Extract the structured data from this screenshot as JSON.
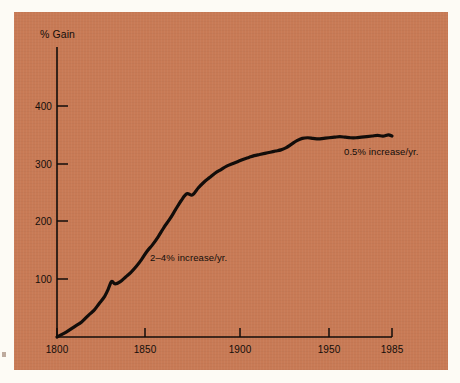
{
  "figure": {
    "background_color": "#fdfbf5",
    "panel_color": "#c87a55",
    "ink_color": "#120d0a"
  },
  "chart_data": {
    "type": "line",
    "title": "",
    "subtitle": "",
    "xlabel": "",
    "ylabel": "% Gain",
    "axis_label_text": "% Gain",
    "grid": false,
    "legend": "none",
    "xlim": [
      1800,
      1985
    ],
    "ylim": [
      0,
      460
    ],
    "xticks": [
      1800,
      1850,
      1900,
      1950,
      1985
    ],
    "xticklabels": [
      "1800",
      "1850",
      "1900",
      "1950",
      "1985"
    ],
    "yticks": [
      100,
      200,
      300,
      400
    ],
    "yticklabels": [
      "100",
      "200",
      "300",
      "400"
    ],
    "series": [
      {
        "name": "% Gain",
        "color": "#120d0a",
        "x": [
          1800,
          1805,
          1810,
          1814,
          1818,
          1821,
          1824,
          1827,
          1829,
          1831,
          1833,
          1836,
          1839,
          1842,
          1845,
          1848,
          1851,
          1854,
          1857,
          1860,
          1863,
          1866,
          1869,
          1872,
          1875,
          1878,
          1881,
          1884,
          1887,
          1890,
          1893,
          1896,
          1899,
          1902,
          1905,
          1908,
          1911,
          1914,
          1917,
          1920,
          1923,
          1926,
          1929,
          1932,
          1935,
          1938,
          1941,
          1944,
          1947,
          1950,
          1953,
          1956,
          1959,
          1962,
          1965,
          1968,
          1971,
          1974,
          1977,
          1980,
          1983,
          1985
        ],
        "y": [
          0,
          8,
          18,
          26,
          38,
          46,
          58,
          70,
          82,
          96,
          92,
          96,
          104,
          112,
          122,
          134,
          148,
          160,
          174,
          190,
          204,
          220,
          236,
          248,
          246,
          258,
          268,
          276,
          284,
          290,
          296,
          300,
          304,
          308,
          311,
          314,
          316,
          318,
          320,
          322,
          324,
          328,
          334,
          340,
          344,
          345,
          344,
          343,
          344,
          345,
          346,
          347,
          346,
          345,
          345,
          346,
          347,
          348,
          349,
          348,
          350,
          348
        ]
      }
    ],
    "annotations": [
      {
        "name": "slow-growth-annotation",
        "text": "2–4% increase/yr.",
        "x": 1853,
        "y": 136
      },
      {
        "name": "plateau-growth-annotation",
        "text": "0.5% increase/yr.",
        "x": 1955,
        "y": 312
      }
    ]
  }
}
